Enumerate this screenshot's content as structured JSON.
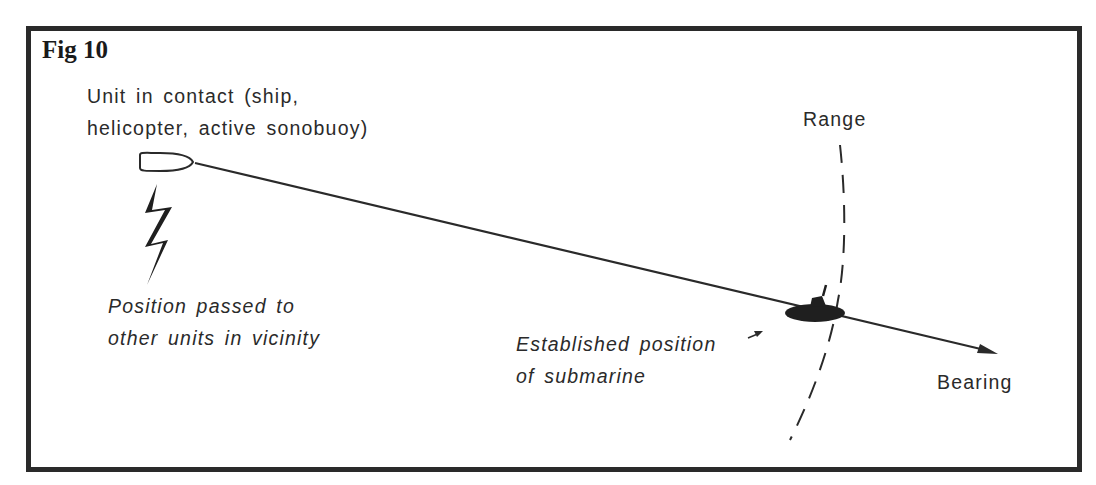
{
  "figure": {
    "title": "Fig 10",
    "unit_label": {
      "line1": "Unit in contact (ship,",
      "line2": "helicopter, active sonobuoy)"
    },
    "position_note": {
      "line1": "Position passed to",
      "line2": "other units in vicinity"
    },
    "submarine_label": {
      "line1": "Established position",
      "line2": "of submarine"
    },
    "range_label": "Range",
    "bearing_label": "Bearing",
    "colors": {
      "ink": "#2a2a2a",
      "background": "#ffffff"
    }
  }
}
